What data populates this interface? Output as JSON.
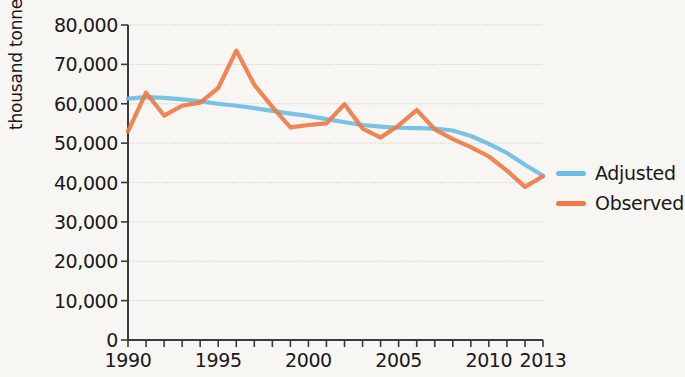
{
  "chart_data": {
    "type": "line",
    "title": "",
    "xlabel": "",
    "ylabel": "thousand tonnes",
    "xlim": [
      1990,
      2013
    ],
    "ylim": [
      0,
      80000
    ],
    "grid": true,
    "legend_position": "right",
    "x": [
      1990,
      1991,
      1992,
      1993,
      1994,
      1995,
      1996,
      1997,
      1998,
      1999,
      2000,
      2001,
      2002,
      2003,
      2004,
      2005,
      2006,
      2007,
      2008,
      2009,
      2010,
      2011,
      2012,
      2013
    ],
    "xtick_labels": [
      "1990",
      "1995",
      "2000",
      "2005",
      "2010",
      "2013"
    ],
    "xtick_values": [
      1990,
      1995,
      2000,
      2005,
      2010,
      2013
    ],
    "ytick_labels": [
      "0",
      "10,000",
      "20,000",
      "30,000",
      "40,000",
      "50,000",
      "60,000",
      "70,000",
      "80,000"
    ],
    "ytick_values": [
      0,
      10000,
      20000,
      30000,
      40000,
      50000,
      60000,
      70000,
      80000
    ],
    "series": [
      {
        "name": "Adjusted",
        "color": "#6bbde4",
        "values": [
          61300,
          61700,
          61500,
          61100,
          60600,
          60000,
          59500,
          58900,
          58200,
          57500,
          56900,
          56100,
          55300,
          54600,
          54200,
          53900,
          53800,
          53700,
          53200,
          51800,
          49800,
          47500,
          44500,
          41700
        ]
      },
      {
        "name": "Observed",
        "color": "#ef7a45",
        "values": [
          53000,
          62800,
          57000,
          59500,
          60300,
          64000,
          73500,
          64800,
          59200,
          54000,
          54600,
          55000,
          59900,
          53700,
          51400,
          54500,
          58400,
          53500,
          51000,
          49000,
          46600,
          43000,
          38900,
          41600
        ]
      }
    ]
  },
  "legend": {
    "items": [
      {
        "label": "Adjusted",
        "color": "#6bbde4"
      },
      {
        "label": "Observed",
        "color": "#ef7a45"
      }
    ]
  },
  "axes": {
    "y_axis_title": "thousand tonnes"
  }
}
